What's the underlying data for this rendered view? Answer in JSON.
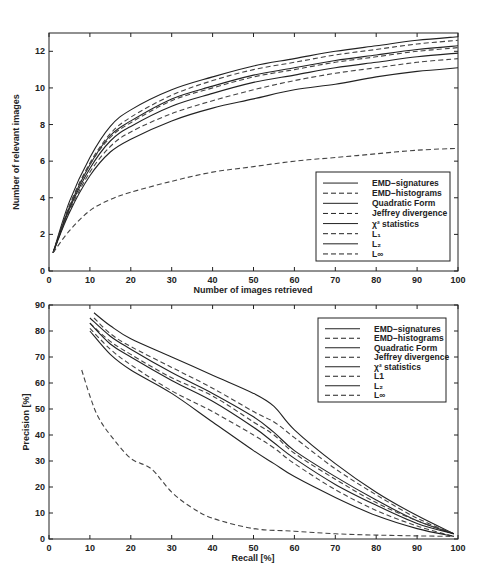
{
  "chart_data": [
    {
      "type": "line",
      "title": "",
      "xlabel": "Number of images retrieved",
      "ylabel": "Number of relevant images",
      "xlim": [
        0,
        100
      ],
      "ylim": [
        0,
        13
      ],
      "xticks": [
        0,
        10,
        20,
        30,
        40,
        50,
        60,
        70,
        80,
        90,
        100
      ],
      "yticks": [
        0,
        2,
        4,
        6,
        8,
        10,
        12
      ],
      "grid": false,
      "legend_position": "lower right",
      "x": [
        1,
        5,
        10,
        15,
        20,
        30,
        40,
        50,
        60,
        70,
        80,
        90,
        100
      ],
      "series": [
        {
          "name": "EMD-signatures",
          "style": "solid",
          "values": [
            1.0,
            3.8,
            6.2,
            7.9,
            8.8,
            9.9,
            10.6,
            11.2,
            11.6,
            12.0,
            12.3,
            12.6,
            12.8
          ]
        },
        {
          "name": "EMD-histograms",
          "style": "dashed",
          "values": [
            1.0,
            3.6,
            5.9,
            7.5,
            8.4,
            9.6,
            10.4,
            11.0,
            11.4,
            11.8,
            12.1,
            12.4,
            12.6
          ]
        },
        {
          "name": "Quadratic Form",
          "style": "solid",
          "values": [
            1.0,
            3.5,
            5.8,
            7.4,
            8.2,
            9.4,
            10.1,
            10.7,
            11.1,
            11.5,
            11.8,
            12.1,
            12.3
          ]
        },
        {
          "name": "Jeffrey divergence",
          "style": "dashed",
          "values": [
            1.0,
            3.5,
            5.8,
            7.3,
            8.1,
            9.3,
            10.0,
            10.6,
            11.0,
            11.4,
            11.7,
            12.0,
            12.2
          ]
        },
        {
          "name": "χ² statistics",
          "style": "solid",
          "values": [
            1.0,
            3.4,
            5.6,
            7.1,
            7.9,
            9.0,
            9.7,
            10.3,
            10.7,
            11.1,
            11.4,
            11.7,
            11.9
          ]
        },
        {
          "name": "L1",
          "style": "dashed",
          "values": [
            1.0,
            3.3,
            5.4,
            6.8,
            7.6,
            8.6,
            9.3,
            9.9,
            10.4,
            10.8,
            11.1,
            11.4,
            11.6
          ]
        },
        {
          "name": "L2",
          "style": "solid",
          "values": [
            1.0,
            3.2,
            5.2,
            6.5,
            7.2,
            8.2,
            8.9,
            9.4,
            9.9,
            10.2,
            10.6,
            10.9,
            11.1
          ]
        },
        {
          "name": "L∞",
          "style": "dashed",
          "values": [
            1.0,
            2.2,
            3.3,
            3.9,
            4.3,
            4.9,
            5.4,
            5.7,
            6.0,
            6.2,
            6.4,
            6.6,
            6.7
          ]
        }
      ]
    },
    {
      "type": "line",
      "title": "",
      "xlabel": "Recall [%]",
      "ylabel": "Precision [%]",
      "xlim": [
        0,
        100
      ],
      "ylim": [
        0,
        90
      ],
      "xticks": [
        0,
        10,
        20,
        30,
        40,
        50,
        60,
        70,
        80,
        90,
        100
      ],
      "yticks": [
        0,
        10,
        20,
        30,
        40,
        50,
        60,
        70,
        80,
        90
      ],
      "grid": false,
      "legend_position": "upper right",
      "series": [
        {
          "name": "EMD-signatures",
          "style": "solid",
          "x": [
            11,
            15,
            20,
            30,
            40,
            50,
            55,
            60,
            70,
            80,
            90,
            99
          ],
          "y": [
            87,
            82,
            77,
            70,
            63,
            56,
            51,
            42,
            29,
            18,
            9,
            2
          ]
        },
        {
          "name": "EMD-histograms",
          "style": "dashed",
          "x": [
            11,
            15,
            20,
            30,
            40,
            50,
            55,
            60,
            70,
            80,
            90,
            99
          ],
          "y": [
            85,
            79,
            74,
            66,
            58,
            49,
            45,
            39,
            27,
            17,
            8,
            2
          ]
        },
        {
          "name": "Quadratic Form",
          "style": "solid",
          "x": [
            10,
            15,
            20,
            30,
            40,
            50,
            55,
            60,
            70,
            80,
            90,
            99
          ],
          "y": [
            85,
            78,
            73,
            64,
            56,
            47,
            41,
            34,
            24,
            15,
            7,
            2
          ]
        },
        {
          "name": "Jeffrey divergence",
          "style": "dashed",
          "x": [
            10,
            15,
            20,
            30,
            40,
            50,
            55,
            60,
            70,
            80,
            90,
            99
          ],
          "y": [
            83,
            76,
            71,
            62,
            55,
            45,
            40,
            33,
            23,
            14,
            7,
            2
          ]
        },
        {
          "name": "χ² statistics",
          "style": "solid",
          "x": [
            10,
            15,
            20,
            30,
            40,
            50,
            55,
            60,
            70,
            80,
            90,
            99
          ],
          "y": [
            83,
            75,
            70,
            61,
            53,
            43,
            37,
            31,
            21,
            13,
            6,
            2
          ]
        },
        {
          "name": "L1",
          "style": "dashed",
          "x": [
            10,
            15,
            20,
            30,
            40,
            50,
            55,
            60,
            70,
            80,
            90,
            99
          ],
          "y": [
            81,
            73,
            67,
            57,
            49,
            40,
            35,
            29,
            19,
            11,
            5,
            1
          ]
        },
        {
          "name": "L2",
          "style": "solid",
          "x": [
            10,
            15,
            20,
            30,
            40,
            50,
            55,
            60,
            70,
            80,
            90,
            99
          ],
          "y": [
            80,
            71,
            65,
            56,
            45,
            34,
            29,
            24,
            16,
            9,
            4,
            1
          ]
        },
        {
          "name": "L∞",
          "style": "dashed",
          "x": [
            8,
            10,
            12,
            15,
            20,
            25,
            30,
            35,
            40,
            50,
            60,
            70,
            80,
            90,
            99
          ],
          "y": [
            65,
            55,
            47,
            40,
            31,
            27,
            18,
            12,
            8,
            4,
            3,
            2,
            1.5,
            1.2,
            1
          ]
        }
      ]
    }
  ],
  "upper": {
    "xlabel": "Number of images retrieved",
    "ylabel": "Number of relevant images",
    "xticks": [
      "0",
      "10",
      "20",
      "30",
      "40",
      "50",
      "60",
      "70",
      "80",
      "90",
      "100"
    ],
    "yticks": [
      "0",
      "2",
      "4",
      "6",
      "8",
      "10",
      "12"
    ]
  },
  "lower": {
    "xlabel": "Recall [%]",
    "ylabel": "Precision [%]",
    "xticks": [
      "0",
      "10",
      "20",
      "30",
      "40",
      "50",
      "60",
      "70",
      "80",
      "90",
      "100"
    ],
    "yticks": [
      "0",
      "10",
      "20",
      "30",
      "40",
      "50",
      "60",
      "70",
      "80",
      "90"
    ]
  },
  "legend_upper": [
    "EMD−signatures",
    "EMD−histograms",
    "Quadratic Form",
    "Jeffrey divergence",
    "χ² statistics",
    "L₁",
    "L₂",
    "L∞"
  ],
  "legend_lower": [
    "EMD−signatures",
    "EMD−histograms",
    "Quadratic Form",
    "Jeffrey divergence",
    "χ² statistics",
    "L1",
    "L₂",
    "L∞"
  ]
}
